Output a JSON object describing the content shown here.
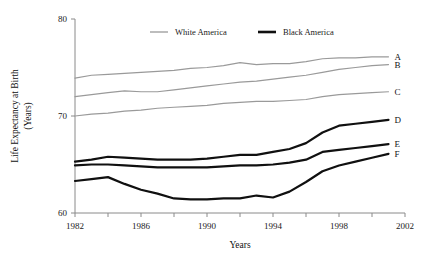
{
  "chart_data": {
    "type": "line",
    "title": "",
    "xlabel": "Years",
    "ylabel": "Life Expectancy at Birth (Years)",
    "ylabel_line1": "Life Expectancy at Birth",
    "ylabel_line2": "(Years)",
    "xlim": [
      1982,
      2002
    ],
    "ylim": [
      60,
      80
    ],
    "grid": false,
    "legend_position": "top-center",
    "x_major_ticks": [
      1982,
      1986,
      1990,
      1994,
      1998,
      2002
    ],
    "x_major_tick_labels": [
      "1982",
      "1986",
      "1990",
      "1994",
      "1998",
      "2002"
    ],
    "x_minor_ticks": [
      1984,
      1988,
      1992,
      1996,
      2000
    ],
    "y_ticks": [
      60,
      70,
      80
    ],
    "y_tick_labels": [
      "60",
      "70",
      "80"
    ],
    "x": [
      1982,
      1983,
      1984,
      1985,
      1986,
      1987,
      1988,
      1989,
      1990,
      1991,
      1992,
      1993,
      1994,
      1995,
      1996,
      1997,
      1998,
      1999,
      2000,
      2001
    ],
    "series": [
      {
        "name": "A",
        "label": "A",
        "group": "White America",
        "color": "#9a9a9a",
        "values": [
          73.9,
          74.2,
          74.3,
          74.4,
          74.5,
          74.6,
          74.7,
          74.9,
          75.0,
          75.2,
          75.5,
          75.3,
          75.4,
          75.4,
          75.6,
          75.9,
          76.0,
          76.0,
          76.1,
          76.1
        ]
      },
      {
        "name": "B",
        "label": "B",
        "group": "White America",
        "color": "#9a9a9a",
        "values": [
          72.0,
          72.2,
          72.4,
          72.6,
          72.5,
          72.5,
          72.7,
          72.9,
          73.1,
          73.3,
          73.5,
          73.6,
          73.8,
          74.0,
          74.2,
          74.5,
          74.8,
          75.0,
          75.2,
          75.3
        ]
      },
      {
        "name": "C",
        "label": "C",
        "group": "White America",
        "color": "#9a9a9a",
        "values": [
          70.0,
          70.2,
          70.3,
          70.5,
          70.6,
          70.8,
          70.9,
          71.0,
          71.1,
          71.3,
          71.4,
          71.5,
          71.5,
          71.6,
          71.7,
          72.0,
          72.2,
          72.3,
          72.4,
          72.5
        ]
      },
      {
        "name": "D",
        "label": "D",
        "group": "Black America",
        "color": "#101010",
        "values": [
          65.3,
          65.5,
          65.8,
          65.7,
          65.6,
          65.5,
          65.5,
          65.5,
          65.6,
          65.8,
          66.0,
          66.0,
          66.3,
          66.6,
          67.2,
          68.3,
          69.0,
          69.2,
          69.4,
          69.6
        ]
      },
      {
        "name": "E",
        "label": "E",
        "group": "Black America",
        "color": "#101010",
        "values": [
          64.9,
          65.0,
          65.0,
          64.9,
          64.8,
          64.7,
          64.7,
          64.7,
          64.7,
          64.8,
          64.9,
          64.9,
          65.0,
          65.2,
          65.5,
          66.3,
          66.5,
          66.7,
          66.9,
          67.1
        ]
      },
      {
        "name": "F",
        "label": "F",
        "group": "Black America",
        "color": "#101010",
        "values": [
          63.3,
          63.5,
          63.7,
          63.0,
          62.4,
          62.0,
          61.5,
          61.4,
          61.4,
          61.5,
          61.5,
          61.8,
          61.6,
          62.2,
          63.2,
          64.3,
          64.9,
          65.3,
          65.7,
          66.1
        ]
      }
    ],
    "legend": [
      {
        "label": "White America",
        "color": "#9a9a9a",
        "style": "thin"
      },
      {
        "label": "Black America",
        "color": "#101010",
        "style": "thick"
      }
    ]
  }
}
